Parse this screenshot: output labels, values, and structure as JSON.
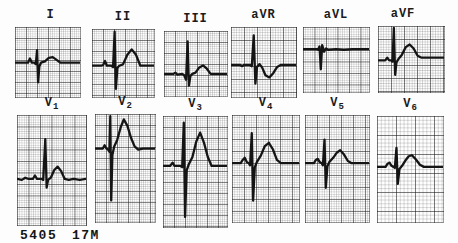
{
  "figure": {
    "footer_id": "5405",
    "footer_age_sex": "17M"
  },
  "chart_data": {
    "type": "line",
    "description_row1": [
      "I",
      "II",
      "III",
      "aVR",
      "aVL",
      "aVF"
    ],
    "description_row2": [
      "V1",
      "V2",
      "V3",
      "V4",
      "V5",
      "V6"
    ],
    "waveform_color": "#141414",
    "grid_bold_color": "#4a4a4a",
    "grid_fine_color": "#b5b5b5",
    "leads": {
      "I": {
        "label": "I",
        "points": [
          [
            0,
            51
          ],
          [
            17,
            51
          ],
          [
            20,
            51
          ],
          [
            23,
            45
          ],
          [
            26,
            51
          ],
          [
            30,
            51
          ],
          [
            32,
            53
          ],
          [
            34,
            33
          ],
          [
            35.5,
            79
          ],
          [
            37.5,
            56
          ],
          [
            40,
            51
          ],
          [
            46,
            49
          ],
          [
            52,
            44
          ],
          [
            58,
            43
          ],
          [
            64,
            47
          ],
          [
            70,
            51
          ],
          [
            82,
            51
          ],
          [
            100,
            51
          ]
        ]
      },
      "II": {
        "label": "II",
        "points": [
          [
            0,
            54
          ],
          [
            15,
            54
          ],
          [
            18,
            53
          ],
          [
            21,
            47
          ],
          [
            24,
            54
          ],
          [
            31,
            54
          ],
          [
            34,
            56
          ],
          [
            36.5,
            4
          ],
          [
            38.5,
            88
          ],
          [
            41,
            57
          ],
          [
            44,
            54
          ],
          [
            50,
            52
          ],
          [
            57,
            38
          ],
          [
            64,
            30
          ],
          [
            71,
            38
          ],
          [
            78,
            54
          ],
          [
            88,
            54
          ],
          [
            100,
            54
          ]
        ]
      },
      "III": {
        "label": "III",
        "points": [
          [
            0,
            66
          ],
          [
            15,
            66
          ],
          [
            18,
            64
          ],
          [
            21,
            67
          ],
          [
            29,
            66
          ],
          [
            32,
            68
          ],
          [
            35,
            75
          ],
          [
            37.5,
            16
          ],
          [
            39.5,
            84
          ],
          [
            42,
            69
          ],
          [
            45,
            66
          ],
          [
            50,
            64
          ],
          [
            56,
            56
          ],
          [
            62,
            53
          ],
          [
            68,
            58
          ],
          [
            74,
            66
          ],
          [
            85,
            66
          ],
          [
            100,
            66
          ]
        ]
      },
      "aVR": {
        "label": "aVR",
        "points": [
          [
            0,
            54
          ],
          [
            14,
            54
          ],
          [
            17,
            56
          ],
          [
            20,
            54
          ],
          [
            29,
            54
          ],
          [
            32,
            56
          ],
          [
            35,
            12
          ],
          [
            37.5,
            81
          ],
          [
            40,
            57
          ],
          [
            44,
            53
          ],
          [
            48,
            58
          ],
          [
            53,
            69
          ],
          [
            59,
            72
          ],
          [
            65,
            66
          ],
          [
            71,
            57
          ],
          [
            77,
            54
          ],
          [
            100,
            54
          ]
        ]
      },
      "aVL": {
        "label": "aVL",
        "points": [
          [
            0,
            34
          ],
          [
            21,
            34
          ],
          [
            23,
            35
          ],
          [
            25,
            30
          ],
          [
            27,
            65
          ],
          [
            29,
            28
          ],
          [
            32,
            38
          ],
          [
            35,
            33
          ],
          [
            38,
            35
          ],
          [
            50,
            34
          ],
          [
            62,
            35
          ],
          [
            75,
            34
          ],
          [
            100,
            34
          ]
        ]
      },
      "aVF": {
        "label": "aVF",
        "points": [
          [
            0,
            52
          ],
          [
            11,
            52
          ],
          [
            14,
            48
          ],
          [
            17,
            52
          ],
          [
            20,
            52
          ],
          [
            22,
            54
          ],
          [
            24,
            3
          ],
          [
            26,
            74
          ],
          [
            28,
            55
          ],
          [
            31,
            50
          ],
          [
            36,
            44
          ],
          [
            42,
            32
          ],
          [
            48,
            28
          ],
          [
            54,
            34
          ],
          [
            60,
            45
          ],
          [
            66,
            48
          ],
          [
            78,
            48
          ],
          [
            100,
            48
          ]
        ]
      },
      "V1": {
        "label_main": "V",
        "label_sub": "1",
        "points": [
          [
            0,
            58
          ],
          [
            7,
            59
          ],
          [
            12,
            57
          ],
          [
            16,
            58
          ],
          [
            23,
            58
          ],
          [
            26,
            55
          ],
          [
            29,
            58
          ],
          [
            35,
            58
          ],
          [
            38,
            59
          ],
          [
            41,
            22
          ],
          [
            43,
            66
          ],
          [
            45,
            59
          ],
          [
            49,
            57
          ],
          [
            54,
            50
          ],
          [
            59,
            47
          ],
          [
            64,
            51
          ],
          [
            69,
            58
          ],
          [
            75,
            59
          ],
          [
            82,
            58
          ],
          [
            91,
            59
          ],
          [
            100,
            58
          ]
        ]
      },
      "V2": {
        "label_main": "V",
        "label_sub": "2",
        "points": [
          [
            0,
            32
          ],
          [
            9,
            32
          ],
          [
            13,
            32
          ],
          [
            16,
            29
          ],
          [
            19,
            32
          ],
          [
            22,
            33
          ],
          [
            24,
            35
          ],
          [
            25.5,
            2
          ],
          [
            27,
            80
          ],
          [
            29,
            38
          ],
          [
            32,
            30
          ],
          [
            37,
            24
          ],
          [
            43,
            12
          ],
          [
            48,
            5
          ],
          [
            54,
            11
          ],
          [
            60,
            22
          ],
          [
            66,
            30
          ],
          [
            72,
            33
          ],
          [
            80,
            32
          ],
          [
            100,
            32
          ]
        ]
      },
      "V3": {
        "label_main": "V",
        "label_sub": "3",
        "points": [
          [
            0,
            45
          ],
          [
            11,
            45
          ],
          [
            15,
            42
          ],
          [
            18,
            45
          ],
          [
            27,
            45
          ],
          [
            30,
            46
          ],
          [
            32.5,
            6
          ],
          [
            34.5,
            91
          ],
          [
            37,
            49
          ],
          [
            40,
            44
          ],
          [
            46,
            37
          ],
          [
            52,
            23
          ],
          [
            58,
            15
          ],
          [
            64,
            24
          ],
          [
            70,
            37
          ],
          [
            76,
            45
          ],
          [
            85,
            45
          ],
          [
            100,
            45
          ]
        ]
      },
      "V4": {
        "label_main": "V",
        "label_sub": "4",
        "points": [
          [
            0,
            45
          ],
          [
            13,
            45
          ],
          [
            16,
            42
          ],
          [
            19,
            40
          ],
          [
            22,
            44
          ],
          [
            25,
            45
          ],
          [
            27,
            47
          ],
          [
            29.5,
            17
          ],
          [
            31.5,
            80
          ],
          [
            34,
            49
          ],
          [
            37,
            44
          ],
          [
            43,
            38
          ],
          [
            49,
            29
          ],
          [
            55,
            26
          ],
          [
            61,
            32
          ],
          [
            67,
            42
          ],
          [
            73,
            45
          ],
          [
            85,
            45
          ],
          [
            100,
            45
          ]
        ]
      },
      "V5": {
        "label_main": "V",
        "label_sub": "5",
        "points": [
          [
            0,
            45
          ],
          [
            14,
            45
          ],
          [
            17,
            42
          ],
          [
            20,
            41
          ],
          [
            23,
            44
          ],
          [
            26,
            45
          ],
          [
            28,
            47
          ],
          [
            30.5,
            23
          ],
          [
            32.5,
            68
          ],
          [
            35,
            48
          ],
          [
            38,
            44
          ],
          [
            44,
            40
          ],
          [
            50,
            35
          ],
          [
            55,
            33
          ],
          [
            61,
            37
          ],
          [
            67,
            43
          ],
          [
            73,
            45
          ],
          [
            86,
            45
          ],
          [
            100,
            45
          ]
        ]
      },
      "V6": {
        "label_main": "V",
        "label_sub": "6",
        "points": [
          [
            0,
            48
          ],
          [
            13,
            48
          ],
          [
            16,
            45
          ],
          [
            19,
            44
          ],
          [
            22,
            47
          ],
          [
            25,
            48
          ],
          [
            27,
            49
          ],
          [
            29.5,
            30
          ],
          [
            31.5,
            64
          ],
          [
            34,
            50
          ],
          [
            38,
            47
          ],
          [
            43,
            42
          ],
          [
            48,
            38
          ],
          [
            53,
            37
          ],
          [
            59,
            41
          ],
          [
            65,
            46
          ],
          [
            71,
            48
          ],
          [
            85,
            48
          ],
          [
            100,
            48
          ]
        ]
      }
    }
  }
}
